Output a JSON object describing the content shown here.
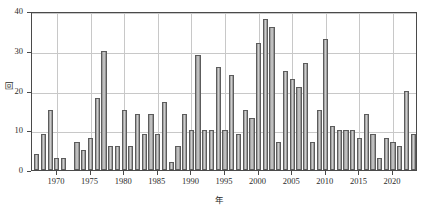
{
  "chart_data": {
    "type": "bar",
    "title": "",
    "subtitle": "",
    "xlabel": "年",
    "ylabel": "回",
    "xlim": [
      1966.3,
      2023.7
    ],
    "ylim": [
      0,
      40
    ],
    "grid": true,
    "legend": null,
    "ytick_labels": [
      "0",
      "10",
      "20",
      "30",
      "40"
    ],
    "ytick_values": [
      0,
      10,
      20,
      30,
      40
    ],
    "xtick_labels": [
      "1970",
      "1975",
      "1980",
      "1985",
      "1990",
      "1995",
      "2000",
      "2005",
      "2010",
      "2015",
      "2020"
    ],
    "xtick_values": [
      1970,
      1975,
      1980,
      1985,
      1990,
      1995,
      2000,
      2005,
      2010,
      2015,
      2020
    ],
    "bar_color": "#b3b3b3",
    "bar_edge_color": "#5c5c5c",
    "categories": [
      1967,
      1968,
      1969,
      1970,
      1971,
      1972,
      1973,
      1974,
      1975,
      1976,
      1977,
      1978,
      1979,
      1980,
      1981,
      1982,
      1983,
      1984,
      1985,
      1986,
      1987,
      1988,
      1989,
      1990,
      1991,
      1992,
      1993,
      1994,
      1995,
      1996,
      1997,
      1998,
      1999,
      2000,
      2001,
      2002,
      2003,
      2004,
      2005,
      2006,
      2007,
      2008,
      2009,
      2010,
      2011,
      2012,
      2013,
      2014,
      2015,
      2016,
      2017,
      2018,
      2019,
      2020,
      2021,
      2022,
      2023
    ],
    "values": [
      4,
      9,
      15,
      3,
      3,
      0,
      7,
      5,
      8,
      18,
      30,
      6,
      6,
      15,
      6,
      14,
      9,
      14,
      9,
      17,
      2,
      6,
      14,
      10,
      29,
      10,
      10,
      26,
      10,
      24,
      9,
      15,
      13,
      32,
      38,
      36,
      7,
      25,
      23,
      21,
      27,
      7,
      15,
      33,
      11,
      10,
      10,
      10,
      8,
      14,
      9,
      3,
      8,
      7,
      6,
      20,
      9
    ]
  }
}
